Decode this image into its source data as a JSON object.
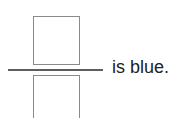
{
  "worksheet": {
    "fraction": {
      "numerator_box": "",
      "denominator_box": ""
    },
    "sentence_suffix": "is blue."
  }
}
